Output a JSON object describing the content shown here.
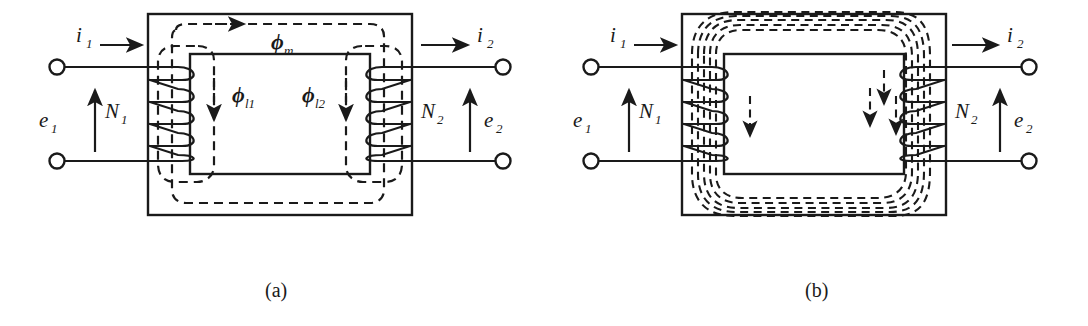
{
  "figure": {
    "type": "engineering-diagram",
    "panels": [
      {
        "id": "a",
        "caption": "(a)",
        "description": "Transformer core showing mutual flux and leakage flux paths",
        "labels": {
          "current_primary": "i",
          "current_primary_sub": "1",
          "current_secondary": "i",
          "current_secondary_sub": "2",
          "emf_primary": "e",
          "emf_primary_sub": "1",
          "emf_secondary": "e",
          "emf_secondary_sub": "2",
          "turns_primary": "N",
          "turns_primary_sub": "1",
          "turns_secondary": "N",
          "turns_secondary_sub": "2",
          "flux_mutual": "ϕ",
          "flux_mutual_sub": "m",
          "flux_leak1": "ϕ",
          "flux_leak1_sub": "l1",
          "flux_leak2": "ϕ",
          "flux_leak2_sub": "l2"
        }
      },
      {
        "id": "b",
        "caption": "(b)",
        "description": "Transformer core showing multiple mutual flux lines linking both windings",
        "labels": {
          "current_primary": "i",
          "current_primary_sub": "1",
          "current_secondary": "i",
          "current_secondary_sub": "2",
          "emf_primary": "e",
          "emf_primary_sub": "1",
          "emf_secondary": "e",
          "emf_secondary_sub": "2",
          "turns_primary": "N",
          "turns_primary_sub": "1",
          "turns_secondary": "N",
          "turns_secondary_sub": "2"
        }
      }
    ],
    "colors": {
      "ink": "#1a1a1a",
      "background": "#ffffff"
    }
  }
}
